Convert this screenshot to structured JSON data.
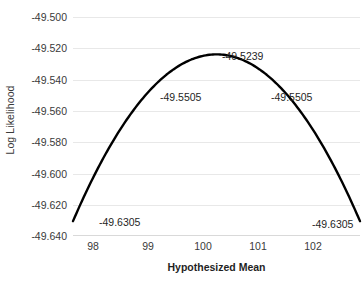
{
  "chart_data": {
    "type": "line",
    "title": "",
    "xlabel": "Hypothesized Mean",
    "ylabel": "Log Likelihood",
    "x": [
      98,
      99,
      100,
      101,
      102
    ],
    "values": [
      -49.6305,
      -49.5505,
      -49.5239,
      -49.5505,
      -49.6305
    ],
    "series": [
      {
        "name": "Log Likelihood",
        "values": [
          -49.6305,
          -49.5505,
          -49.5239,
          -49.5505,
          -49.6305
        ]
      }
    ],
    "xlim": [
      98,
      102
    ],
    "ylim": [
      -49.64,
      -49.5
    ],
    "xticks": [
      "98",
      "99",
      "100",
      "101",
      "102"
    ],
    "yticks": [
      "-49.500",
      "-49.520",
      "-49.540",
      "-49.560",
      "-49.580",
      "-49.600",
      "-49.620",
      "-49.640"
    ],
    "ytick_values": [
      -49.5,
      -49.52,
      -49.54,
      -49.56,
      -49.58,
      -49.6,
      -49.62,
      -49.64
    ],
    "grid": true,
    "legend": "none",
    "line_color": "#000000",
    "grid_color": "#e8e8e8",
    "annotations": [
      {
        "text": "-49.6305",
        "x": 98,
        "y": -49.6305,
        "anchor": "right-of-point"
      },
      {
        "text": "-49.5505",
        "x": 99,
        "y": -49.5505,
        "anchor": "right-of-point"
      },
      {
        "text": "-49.5239",
        "x": 100,
        "y": -49.5239,
        "anchor": "right-of-point"
      },
      {
        "text": "-49.5505",
        "x": 101,
        "y": -49.5505,
        "anchor": "right-of-point"
      },
      {
        "text": "-49.6305",
        "x": 102,
        "y": -49.6305,
        "anchor": "right-of-point"
      }
    ]
  },
  "axes": {
    "y_title": "Log Likelihood",
    "x_title": "Hypothesized Mean",
    "y_labels": [
      "-49.500",
      "-49.520",
      "-49.540",
      "-49.560",
      "-49.580",
      "-49.600",
      "-49.620",
      "-49.640"
    ],
    "x_labels": [
      "98",
      "99",
      "100",
      "101",
      "102"
    ]
  },
  "labels": {
    "peak": "-49.5239",
    "mid_left": "-49.5505",
    "mid_right": "-49.5505",
    "end_left": "-49.6305",
    "end_right": "-49.6305"
  }
}
